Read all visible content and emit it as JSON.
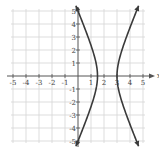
{
  "chart_data": {
    "type": "line",
    "title": "",
    "xlabel": "x",
    "ylabel": "y",
    "xlim": [
      -5,
      5
    ],
    "ylim": [
      -5,
      5
    ],
    "grid": true,
    "x_ticks": [
      -5,
      -4,
      -3,
      -2,
      -1,
      1,
      2,
      3,
      4,
      5
    ],
    "y_ticks": [
      -5,
      -4,
      -3,
      -2,
      -1,
      1,
      2,
      3,
      4,
      5
    ],
    "x_tick_labels": [
      "-5",
      "-4",
      "-3",
      "-2",
      "-1",
      "1",
      "2",
      "3",
      "4",
      "5"
    ],
    "y_tick_labels": [
      "-5",
      "-4",
      "-3",
      "-2",
      "-1",
      "1",
      "2",
      "3",
      "4",
      "5"
    ],
    "series": [
      {
        "name": "left branch",
        "points": [
          [
            0.0,
            5
          ],
          [
            0.5,
            3.4
          ],
          [
            1.0,
            1.8
          ],
          [
            1.25,
            1.1
          ],
          [
            1.5,
            0
          ],
          [
            1.25,
            -1.1
          ],
          [
            1.0,
            -1.8
          ],
          [
            0.5,
            -3.4
          ],
          [
            0.0,
            -5
          ]
        ]
      },
      {
        "name": "right branch",
        "points": [
          [
            4.5,
            5
          ],
          [
            4.0,
            3.4
          ],
          [
            3.5,
            1.8
          ],
          [
            3.25,
            1.1
          ],
          [
            3.0,
            0
          ],
          [
            3.25,
            -1.1
          ],
          [
            3.5,
            -1.8
          ],
          [
            4.0,
            -3.4
          ],
          [
            4.5,
            -5
          ]
        ]
      }
    ],
    "vertices": [
      [
        1.5,
        0
      ],
      [
        3,
        0
      ]
    ],
    "center": [
      2.25,
      0
    ],
    "color": "#3a3a3a"
  }
}
